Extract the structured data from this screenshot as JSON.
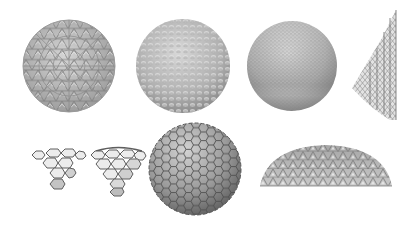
{
  "figure": {
    "background": "#ffffff",
    "panels": [
      {
        "id": "geodesic-sphere-triangulated",
        "shape": "sphere",
        "pattern": "geodesic-triangles",
        "bbox": [
          22,
          20,
          94,
          92
        ]
      },
      {
        "id": "geodesic-sphere-dimpled",
        "shape": "sphere",
        "pattern": "dimpled-hex",
        "bbox": [
          135,
          20,
          96,
          93
        ]
      },
      {
        "id": "geodesic-sphere-fine",
        "shape": "sphere",
        "pattern": "fine-mesh",
        "bbox": [
          247,
          21,
          91,
          90
        ]
      },
      {
        "id": "lattice-cone-section",
        "shape": "cone-section",
        "pattern": "lattice",
        "bbox": [
          350,
          8,
          48,
          110
        ]
      },
      {
        "id": "hex-patch-flat",
        "shape": "hex-patch",
        "pattern": "hexagons",
        "bbox": [
          28,
          146,
          58,
          44
        ]
      },
      {
        "id": "hex-patch-curved",
        "shape": "hex-patch-curved",
        "pattern": "hexagons",
        "bbox": [
          88,
          144,
          58,
          52
        ]
      },
      {
        "id": "hex-sphere",
        "shape": "sphere",
        "pattern": "hexagons",
        "bbox": [
          148,
          121,
          94,
          95
        ]
      },
      {
        "id": "geodesic-dome",
        "shape": "dome",
        "pattern": "geodesic-triangles",
        "bbox": [
          259,
          144,
          134,
          44
        ]
      }
    ],
    "colors": {
      "mesh_light": "#d9d9d9",
      "mesh_mid": "#a8a8a8",
      "mesh_dark": "#6e6e6e",
      "hex_fill_light": "#e6e6e6",
      "hex_fill_dark": "#7a7a7a",
      "hex_stroke": "#5a5a5a"
    }
  }
}
